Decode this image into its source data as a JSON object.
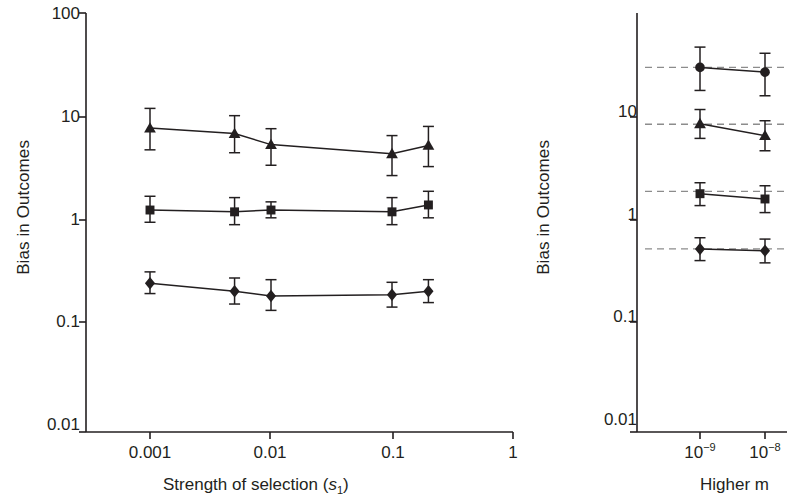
{
  "figure": {
    "kind": "two-panel-line-chart-with-error-bars",
    "background": "#ffffff",
    "ink_color": "#231f20"
  },
  "panel_left": {
    "ylabel": "Bias in Outcomes",
    "xlabel_prefix": "Strength of selection (",
    "xlabel_italic": "s",
    "xlabel_sub": "1",
    "xlabel_suffix": ")",
    "y_ticks": [
      "100",
      "10",
      "1",
      "0.1",
      "0.01"
    ],
    "x_ticks": [
      "0.001",
      "0.01",
      "0.1",
      "1"
    ]
  },
  "panel_right": {
    "ylabel": "Bias in Outcomes",
    "xlabel": "Higher m",
    "y_ticks": [
      "10",
      "1",
      "0.1",
      "0.01"
    ],
    "x_ticks": [
      {
        "mantissa": "10",
        "exponent": "−9"
      },
      {
        "mantissa": "10",
        "exponent": "−8"
      }
    ]
  },
  "chart_data": [
    {
      "type": "line",
      "panel": "left",
      "title": "",
      "xlabel": "Strength of selection (s1)",
      "ylabel": "Bias in Outcomes",
      "xscale": "log",
      "yscale": "log",
      "xlim": [
        0.0005,
        1
      ],
      "ylim": [
        0.01,
        100
      ],
      "grid": false,
      "legend": "none",
      "x_tick_values": [
        0.001,
        0.01,
        0.1,
        1
      ],
      "y_tick_values": [
        0.01,
        0.1,
        1,
        10,
        100
      ],
      "x": [
        0.001,
        0.005,
        0.01,
        0.1,
        0.2
      ],
      "series": [
        {
          "name": "triangle-series",
          "marker": "triangle",
          "values": [
            7.8,
            6.9,
            5.4,
            4.4,
            5.3
          ],
          "err_low": [
            3.0,
            2.4,
            2.0,
            1.7,
            2.0
          ],
          "err_high": [
            4.3,
            3.4,
            2.3,
            2.2,
            2.8
          ]
        },
        {
          "name": "square-series",
          "marker": "square",
          "values": [
            1.25,
            1.2,
            1.25,
            1.2,
            1.4
          ],
          "err_low": [
            0.3,
            0.3,
            0.2,
            0.3,
            0.35
          ],
          "err_high": [
            0.45,
            0.45,
            0.25,
            0.45,
            0.5
          ]
        },
        {
          "name": "diamond-series",
          "marker": "diamond",
          "values": [
            0.24,
            0.2,
            0.18,
            0.185,
            0.2
          ],
          "err_low": [
            0.05,
            0.05,
            0.05,
            0.045,
            0.045
          ],
          "err_high": [
            0.07,
            0.07,
            0.08,
            0.06,
            0.06
          ]
        }
      ]
    },
    {
      "type": "line",
      "panel": "right",
      "title": "",
      "xlabel": "Higher m",
      "ylabel": "Bias in Outcomes",
      "xscale": "log",
      "yscale": "log",
      "ylim": [
        0.01,
        100
      ],
      "grid": false,
      "legend": "none",
      "note": "panel is cropped at the right edge of the image",
      "y_tick_values": [
        0.01,
        0.1,
        1,
        10
      ],
      "x_tick_values": [
        1e-09,
        1e-08
      ],
      "x": [
        1e-09,
        1e-08
      ],
      "reference_lines": [
        30,
        8.5,
        1.9,
        0.52
      ],
      "series": [
        {
          "name": "circle-series",
          "marker": "circle",
          "values": [
            30,
            27
          ],
          "err_low": [
            12,
            11
          ],
          "err_high": [
            17,
            14
          ]
        },
        {
          "name": "triangle-series",
          "marker": "triangle",
          "values": [
            8.6,
            6.6
          ],
          "err_low": [
            2.4,
            1.9
          ],
          "err_high": [
            3.2,
            2.6
          ]
        },
        {
          "name": "square-series",
          "marker": "square",
          "values": [
            1.8,
            1.6
          ],
          "err_low": [
            0.42,
            0.42
          ],
          "err_high": [
            0.5,
            0.55
          ]
        },
        {
          "name": "diamond-series",
          "marker": "diamond",
          "values": [
            0.52,
            0.5
          ],
          "err_low": [
            0.12,
            0.12
          ],
          "err_high": [
            0.15,
            0.15
          ]
        }
      ]
    }
  ]
}
